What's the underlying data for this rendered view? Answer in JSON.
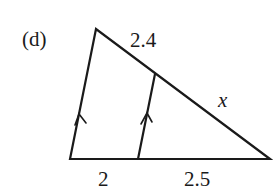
{
  "figure": {
    "part_label": "(d)",
    "labels": {
      "top_side": "2.4",
      "hypotenuse_lower": "x",
      "base_left": "2",
      "base_right": "2.5"
    },
    "colors": {
      "stroke": "#1a1a1a",
      "background": "#ffffff"
    }
  }
}
